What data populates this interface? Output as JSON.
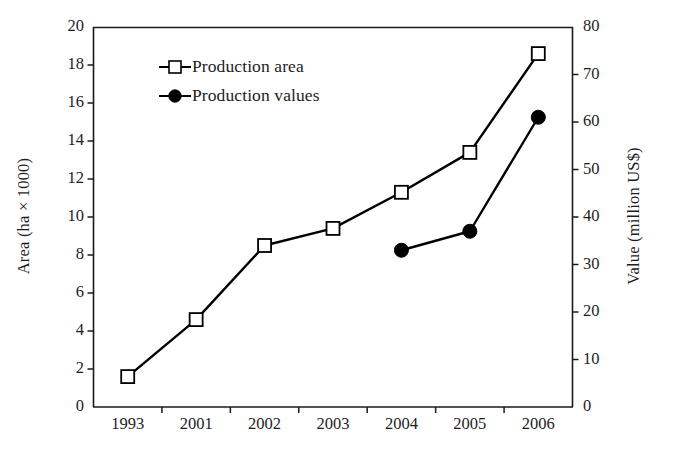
{
  "chart_data": {
    "type": "line",
    "title": "",
    "subtitle": "",
    "categories": [
      "1993",
      "2001",
      "2002",
      "2003",
      "2004",
      "2005",
      "2006"
    ],
    "series": [
      {
        "name": "Production area",
        "axis": "left",
        "marker": "open-square",
        "color": "#000000",
        "values": [
          1.6,
          4.6,
          8.5,
          9.4,
          11.3,
          13.4,
          18.6
        ]
      },
      {
        "name": "Production values",
        "axis": "right",
        "marker": "filled-circle",
        "color": "#000000",
        "values": [
          null,
          null,
          null,
          null,
          33,
          37,
          61
        ]
      }
    ],
    "xlabel": "",
    "ylabel": "Area (ha × 1000)",
    "y2label": "Value (million US$)",
    "ylim": [
      0,
      20
    ],
    "y2lim": [
      0,
      80
    ],
    "yticks": [
      "0",
      "2",
      "4",
      "6",
      "8",
      "10",
      "12",
      "14",
      "16",
      "18",
      "20"
    ],
    "y2ticks": [
      "0",
      "10",
      "20",
      "30",
      "40",
      "50",
      "60",
      "70",
      "80"
    ],
    "grid": false,
    "legend_position": "upper-left-inside"
  },
  "axes": {
    "left_title": "Area (ha × 1000)",
    "right_title": "Value (million US$)",
    "y_left_ticks": [
      "0",
      "2",
      "4",
      "6",
      "8",
      "10",
      "12",
      "14",
      "16",
      "18",
      "20"
    ],
    "y_right_ticks": [
      "0",
      "10",
      "20",
      "30",
      "40",
      "50",
      "60",
      "70",
      "80"
    ],
    "x_ticks": [
      "1993",
      "2001",
      "2002",
      "2003",
      "2004",
      "2005",
      "2006"
    ]
  },
  "legend": {
    "items": [
      {
        "label": "Production area",
        "marker": "open-square-icon"
      },
      {
        "label": "Production values",
        "marker": "filled-circle-icon"
      }
    ]
  }
}
